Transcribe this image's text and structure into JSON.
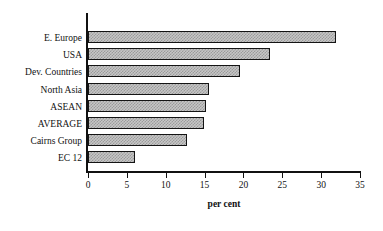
{
  "chart_data": {
    "type": "bar",
    "orientation": "horizontal",
    "title": "",
    "subtitle": "",
    "xlabel": "per cent",
    "ylabel": "",
    "categories": [
      "E. Europe",
      "USA",
      "Dev. Countries",
      "North Asia",
      "ASEAN",
      "AVERAGE",
      "Cairns Group",
      "EC 12"
    ],
    "values": [
      31.9,
      23.4,
      19.5,
      15.6,
      15.2,
      14.9,
      12.8,
      6.1
    ],
    "xlim": [
      0,
      35
    ],
    "xticks": [
      0,
      5,
      10,
      15,
      20,
      25,
      30,
      35
    ],
    "xtick_labels": [
      "0",
      "5",
      "10",
      "15",
      "20",
      "25",
      "30",
      "35"
    ],
    "grid": false,
    "legend": false,
    "bar_fill": "#c6c6c6",
    "bar_pattern": "checkered-hatch",
    "bar_border": "#141414",
    "axis_color": "#111111",
    "background": "#ffffff"
  },
  "axis": {
    "x_title": "per cent"
  }
}
